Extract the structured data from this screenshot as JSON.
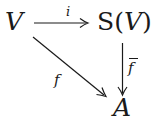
{
  "diagram": {
    "type": "commutative-diagram",
    "nodes": {
      "V": {
        "text": "V",
        "style": "italic"
      },
      "SV": {
        "prefix": "S(",
        "var": "V",
        "suffix": ")"
      },
      "A": {
        "text": "A",
        "style": "italic"
      }
    },
    "arrows": {
      "i": {
        "from": "V",
        "to": "S(V)",
        "label": "i"
      },
      "f": {
        "from": "V",
        "to": "A",
        "label": "f"
      },
      "fbar": {
        "from": "S(V)",
        "to": "A",
        "label": "f",
        "overline": true
      }
    },
    "colors": {
      "ink": "#1a1a1a",
      "background": "#ffffff"
    }
  }
}
